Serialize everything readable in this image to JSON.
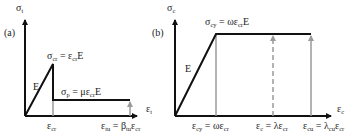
{
  "panel_a": {
    "tag": "(a)",
    "y_axis_label": "σ",
    "y_axis_sub": "t",
    "x_axis_label": "ε",
    "x_axis_sub": "t",
    "slope_label": "E",
    "peak_label": {
      "s1": "σ",
      "s1sub": "cr",
      "eq": " = ε",
      "s2sub": "cr",
      "tail": "E"
    },
    "plateau_label": {
      "s1": "σ",
      "s1sub": "p",
      "eq": " = με",
      "s2sub": "cr",
      "tail": "E"
    },
    "x_tick_1": {
      "s": "ε",
      "sub": "cr"
    },
    "x_tick_2": {
      "s": "ε",
      "sub": "tu",
      "eq": " = β",
      "sub2": "tu",
      "tail": "ε",
      "sub3": "cr"
    }
  },
  "panel_b": {
    "tag": "(b)",
    "y_axis_label": "σ",
    "y_axis_sub": "c",
    "x_axis_label": "ε",
    "x_axis_sub": "c",
    "slope_label": "E",
    "peak_label": {
      "s1": "σ",
      "s1sub": "cy",
      "eq": " = ωε",
      "s2sub": "cr",
      "tail": "E"
    },
    "x_tick_1": {
      "s": "ε",
      "sub": "cy",
      "eq": " = ωε",
      "sub2": "cr"
    },
    "x_tick_2": {
      "s": "ε",
      "sub": "c",
      "eq": " = λε",
      "sub2": "cr"
    },
    "x_tick_3": {
      "s": "ε",
      "sub": "cu",
      "eq": " = λ",
      "sub2": "cu",
      "tail": "ε",
      "sub3": "cr"
    }
  },
  "colors": {
    "line": "#111111",
    "gray": "#9a9a9a"
  }
}
